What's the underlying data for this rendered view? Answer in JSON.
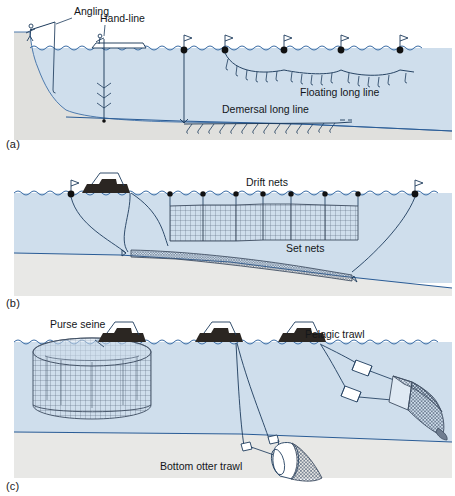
{
  "figure": {
    "colors": {
      "water": "#cfdeec",
      "water_deep": "#c3d6e8",
      "seabed": "#e8e8e6",
      "seabed_edge": "#2a5c96",
      "line": "#1d3b5c",
      "boat": "#2b2622",
      "net": "#4a5a70",
      "surface": "#2a5c96",
      "text": "#13161a",
      "page": "#ffffff"
    }
  },
  "panels": [
    {
      "id": "a",
      "caption": "(a)",
      "labels": [
        {
          "key": "angling",
          "text": "Angling",
          "x": 74,
          "y": 15
        },
        {
          "key": "handline",
          "text": "Hand-line",
          "x": 100,
          "y": 22
        },
        {
          "key": "floating",
          "text": "Floating long line",
          "x": 300,
          "y": 91
        },
        {
          "key": "demersal",
          "text": "Demersal long line",
          "x": 268,
          "y": 112
        }
      ],
      "gear": [
        {
          "name": "angling-rod",
          "type": "rod-and-line",
          "count": 1
        },
        {
          "name": "hand-line-boat",
          "type": "boat-handline",
          "count": 1
        },
        {
          "name": "floating-long-line",
          "type": "long-line",
          "buoys": 5
        },
        {
          "name": "demersal-long-line",
          "type": "long-line",
          "hooks": 14
        }
      ]
    },
    {
      "id": "b",
      "caption": "(b)",
      "labels": [
        {
          "key": "driftnets",
          "text": "Drift nets",
          "x": 270,
          "y": 183
        },
        {
          "key": "setnets",
          "text": "Set nets",
          "x": 300,
          "y": 249
        }
      ],
      "gear": [
        {
          "name": "drift-net-panel",
          "type": "drift-net",
          "panels": 6,
          "floats": 7
        },
        {
          "name": "set-net-panel",
          "type": "set-net",
          "panels": 1
        },
        {
          "name": "fishing-boat",
          "type": "boat",
          "count": 1
        },
        {
          "name": "marker-buoy",
          "type": "flag-buoy",
          "count": 2
        }
      ]
    },
    {
      "id": "c",
      "caption": "(c)",
      "labels": [
        {
          "key": "purseseine",
          "text": "Purse seine",
          "x": 50,
          "y": 323
        },
        {
          "key": "pelagictrawl",
          "text": "Pelagic trawl",
          "x": 305,
          "y": 333
        },
        {
          "key": "bottomtrawl",
          "text": "Bottom otter trawl",
          "x": 160,
          "y": 466
        }
      ],
      "gear": [
        {
          "name": "purse-seine-net",
          "type": "purse-seine",
          "count": 1
        },
        {
          "name": "pelagic-trawl-net",
          "type": "midwater-trawl",
          "otter_boards": 2
        },
        {
          "name": "bottom-otter-trawl",
          "type": "bottom-trawl",
          "otter_boards": 2
        },
        {
          "name": "fishing-boat",
          "type": "boat",
          "count": 3
        }
      ]
    }
  ]
}
